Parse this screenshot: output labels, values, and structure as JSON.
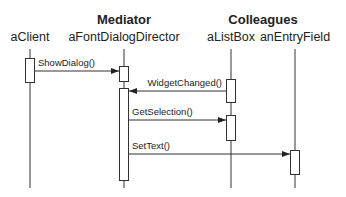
{
  "diagram": {
    "type": "sequence",
    "groups": [
      {
        "id": "mediator",
        "label": "Mediator"
      },
      {
        "id": "colleagues",
        "label": "Colleagues"
      }
    ],
    "participants": [
      {
        "id": "client",
        "label": "aClient"
      },
      {
        "id": "director",
        "label": "aFontDialogDirector",
        "group": "mediator"
      },
      {
        "id": "listbox",
        "label": "aListBox",
        "group": "colleagues"
      },
      {
        "id": "entryfield",
        "label": "anEntryField",
        "group": "colleagues"
      }
    ],
    "messages": [
      {
        "from": "client",
        "to": "director",
        "label": "ShowDialog()"
      },
      {
        "from": "listbox",
        "to": "director",
        "label": "WidgetChanged()"
      },
      {
        "from": "director",
        "to": "listbox",
        "label": "GetSelection()"
      },
      {
        "from": "director",
        "to": "entryfield",
        "label": "SetText()"
      }
    ]
  }
}
